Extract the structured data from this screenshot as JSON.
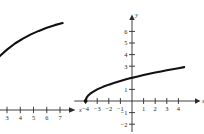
{
  "figure": {
    "title": "",
    "panel_count": 2
  },
  "chart_data": [
    {
      "id": "left-panel",
      "type": "line",
      "title": "",
      "description": "Partially cropped graph: increasing concave-down curve above a horizontal x-axis number line",
      "xlabel": "x",
      "ylabel": "",
      "x_ticks": [
        3,
        4,
        5,
        6,
        7
      ],
      "x_tick_labels": [
        "3",
        "4",
        "5",
        "6",
        "7"
      ],
      "y_ticks": [],
      "y_tick_labels": [],
      "xlim": [
        2.4,
        8.2
      ],
      "ylim": [
        0,
        6
      ],
      "grid": false,
      "legend": null,
      "axis_arrow_x": true,
      "axis_arrow_y": false,
      "series": [
        {
          "name": "curve",
          "points": [
            [
              2.4,
              3.05
            ],
            [
              3.0,
              3.45
            ],
            [
              3.6,
              3.8
            ],
            [
              4.2,
              4.08
            ],
            [
              4.8,
              4.32
            ],
            [
              5.4,
              4.52
            ],
            [
              6.0,
              4.7
            ],
            [
              6.6,
              4.85
            ],
            [
              7.2,
              4.97
            ]
          ]
        }
      ]
    },
    {
      "id": "right-panel",
      "type": "line",
      "title": "",
      "description": "Square-root type curve y = sqrt(x + 4) starting at (-4, 0) and rising rightward",
      "xlabel": "x",
      "ylabel": "y",
      "x_ticks": [
        -4,
        -3,
        -2,
        -1,
        1,
        2,
        3,
        4
      ],
      "x_tick_labels": [
        "−4",
        "−3",
        "−2",
        "−1",
        "1",
        "2",
        "3",
        "4"
      ],
      "y_ticks": [
        -2,
        -1,
        1,
        2,
        3,
        4,
        5,
        6
      ],
      "y_tick_labels": [
        "−2",
        "−1",
        "1",
        "",
        "3",
        "4",
        "5",
        "6"
      ],
      "xlim": [
        -4.8,
        5.0
      ],
      "ylim": [
        -2.5,
        6.8
      ],
      "grid": false,
      "legend": null,
      "axis_arrow_x": true,
      "axis_arrow_y": true,
      "origin_label": "",
      "series": [
        {
          "name": "y = sqrt(x + 4)",
          "points": [
            [
              -4.0,
              0.0
            ],
            [
              -3.9,
              0.32
            ],
            [
              -3.8,
              0.45
            ],
            [
              -3.6,
              0.63
            ],
            [
              -3.4,
              0.77
            ],
            [
              -3.0,
              1.0
            ],
            [
              -2.5,
              1.22
            ],
            [
              -2.0,
              1.41
            ],
            [
              -1.5,
              1.58
            ],
            [
              -1.0,
              1.73
            ],
            [
              -0.5,
              1.87
            ],
            [
              0.0,
              2.0
            ],
            [
              0.5,
              2.12
            ],
            [
              1.0,
              2.24
            ],
            [
              1.5,
              2.35
            ],
            [
              2.0,
              2.45
            ],
            [
              2.5,
              2.55
            ],
            [
              3.0,
              2.65
            ],
            [
              3.5,
              2.74
            ],
            [
              4.0,
              2.83
            ],
            [
              4.5,
              2.92
            ]
          ]
        }
      ],
      "endpoint_marker": {
        "x": -4,
        "y": 0,
        "filled": true
      }
    }
  ]
}
